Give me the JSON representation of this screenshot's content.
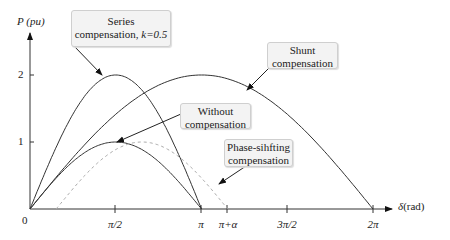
{
  "chart_data": {
    "type": "line",
    "title": "",
    "xlabel": "δ (rad)",
    "ylabel": "P (pu)",
    "x_ticks": [
      "0",
      "π/2",
      "π",
      "π+α",
      "3π/2",
      "2π"
    ],
    "y_ticks": [
      "1",
      "2"
    ],
    "xlim": [
      0,
      6.6
    ],
    "ylim": [
      0,
      2.4
    ],
    "alpha_rad": 0.48,
    "series": [
      {
        "name": "Without compensation",
        "formula": "sin(δ)",
        "domain": [
          0,
          3.1416
        ],
        "peak": {
          "x": 1.5708,
          "y": 1
        },
        "style": "solid"
      },
      {
        "name": "Series compensation, k=0.5",
        "formula": "2·sin(δ)",
        "domain": [
          0,
          3.1416
        ],
        "peak": {
          "x": 1.5708,
          "y": 2
        },
        "style": "solid"
      },
      {
        "name": "Shunt compensation",
        "formula": "2·sin(δ/2)",
        "domain": [
          0,
          6.2832
        ],
        "peak": {
          "x": 3.1416,
          "y": 2
        },
        "style": "solid"
      },
      {
        "name": "Phase-sihfting compensation",
        "formula": "sin(δ-α)",
        "domain": [
          0.48,
          3.62
        ],
        "peak": {
          "x": 2.05,
          "y": 1
        },
        "style": "dashed"
      }
    ],
    "annotations": [
      {
        "text": "Series compensation, k=0.5"
      },
      {
        "text": "Shunt compensation"
      },
      {
        "text": "Without compensation"
      },
      {
        "text": "Phase-sihfting compensation"
      }
    ]
  },
  "axis": {
    "y_label_main": "P",
    "y_label_unit": "(pu)",
    "x_label_main": "δ",
    "x_label_unit": "(rad)",
    "origin": "0",
    "y1": "1",
    "y2": "2",
    "x_pi2": "π/2",
    "x_pi": "π",
    "x_pia": "π+α",
    "x_3pi2": "3π/2",
    "x_2pi": "2π"
  },
  "labels": {
    "series_line1": "Series",
    "series_line2a": "compensation, ",
    "series_line2b": "k=0.5",
    "shunt_line1": "Shunt",
    "shunt_line2": "compensation",
    "without_line1": "Without",
    "without_line2": "compensation",
    "phase_line1": "Phase-sihfting",
    "phase_line2": "compensation"
  }
}
